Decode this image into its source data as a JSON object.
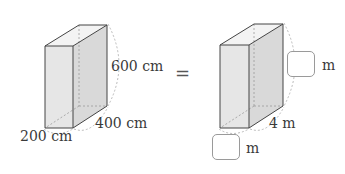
{
  "left_prism": {
    "height_label": "600 cm",
    "depth_label": "400 cm",
    "width_label": "200 cm"
  },
  "equals": "=",
  "right_prism": {
    "height_unit": "m",
    "depth_label": "4 m",
    "width_unit": "m"
  },
  "colors": {
    "edge": "#444444",
    "face_front": "#e6e6e6",
    "face_side": "#d8d8d8",
    "face_top": "#f2f2f2",
    "hidden_edge": "#999999"
  }
}
